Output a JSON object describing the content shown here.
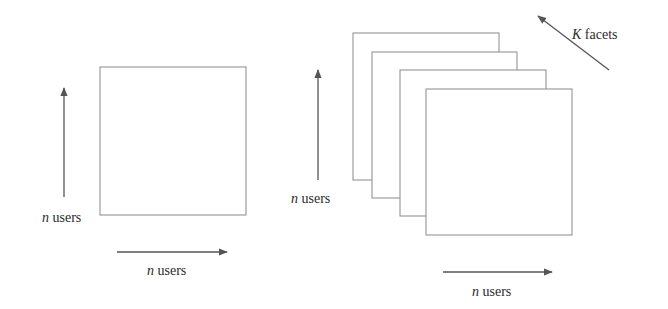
{
  "figure": {
    "left_panel": {
      "matrix": {
        "rows": "n users",
        "cols": "n users"
      },
      "vertical_label_var": "n",
      "vertical_label_text": " users",
      "horizontal_label_var": "n",
      "horizontal_label_text": " users"
    },
    "right_panel": {
      "stack_count": 4,
      "vertical_label_var": "n",
      "vertical_label_text": " users",
      "horizontal_label_var": "n",
      "horizontal_label_text": " users",
      "depth_label_var": "K",
      "depth_label_text": " facets"
    },
    "colors": {
      "stroke": "#8a8a8a",
      "arrow": "#555555",
      "text": "#2a2a2a",
      "background": "#ffffff"
    }
  }
}
